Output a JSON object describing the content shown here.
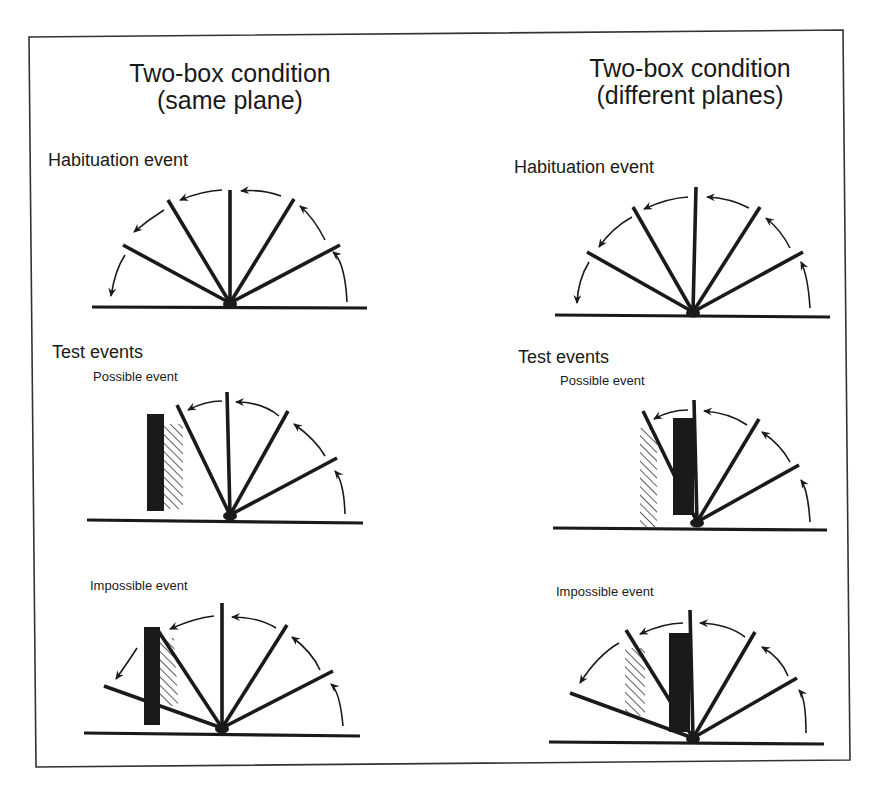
{
  "figure": {
    "frame": {
      "points": "29,37 843,30 850,760 36,767",
      "stroke": "#333333"
    },
    "ink": "#1a1a1a"
  },
  "left_column": {
    "title_line1": "Two-box condition",
    "title_line2": "(same plane)",
    "habituation_label": "Habituation event",
    "test_label": "Test events",
    "possible_label": "Possible event",
    "impossible_label": "Impossible event"
  },
  "right_column": {
    "title_line1": "Two-box condition",
    "title_line2": "(different planes)",
    "habituation_label": "Habituation event",
    "test_label": "Test events",
    "possible_label": "Possible event",
    "impossible_label": "Impossible event"
  },
  "panels": [
    {
      "id": "left-habituation",
      "ground": [
        92,
        307,
        367,
        308
      ],
      "pivot": [
        230,
        303
      ],
      "screen_positions": [
        [
          123,
          245
        ],
        [
          168,
          200
        ],
        [
          230,
          190
        ],
        [
          294,
          199
        ],
        [
          340,
          245
        ]
      ],
      "arrows": [
        {
          "from": [
            347,
            302
          ],
          "ctrl": [
            345,
            262
          ],
          "to": [
            333,
            252
          ]
        },
        {
          "from": [
            325,
            240
          ],
          "ctrl": [
            314,
            218
          ],
          "to": [
            300,
            206
          ]
        },
        {
          "from": [
            281,
            196
          ],
          "ctrl": [
            262,
            189
          ],
          "to": [
            241,
            191
          ]
        },
        {
          "from": [
            222,
            190
          ],
          "ctrl": [
            202,
            191
          ],
          "to": [
            180,
            200
          ]
        },
        {
          "from": [
            164,
            210
          ],
          "ctrl": [
            148,
            220
          ],
          "to": [
            134,
            232
          ]
        },
        {
          "from": [
            125,
            255
          ],
          "ctrl": [
            115,
            270
          ],
          "to": [
            111,
            296
          ]
        }
      ],
      "box": null,
      "hatch": null
    },
    {
      "id": "right-habituation",
      "ground": [
        555,
        315,
        830,
        317
      ],
      "pivot": [
        693,
        312
      ],
      "screen_positions": [
        [
          587,
          252
        ],
        [
          633,
          207
        ],
        [
          696,
          187
        ],
        [
          760,
          207
        ],
        [
          803,
          252
        ]
      ],
      "arrows": [
        {
          "from": [
            810,
            308
          ],
          "ctrl": [
            808,
            276
          ],
          "to": [
            801,
            262
          ]
        },
        {
          "from": [
            790,
            248
          ],
          "ctrl": [
            781,
            230
          ],
          "to": [
            766,
            218
          ]
        },
        {
          "from": [
            749,
            208
          ],
          "ctrl": [
            730,
            198
          ],
          "to": [
            707,
            197
          ]
        },
        {
          "from": [
            688,
            197
          ],
          "ctrl": [
            668,
            198
          ],
          "to": [
            644,
            209
          ]
        },
        {
          "from": [
            632,
            217
          ],
          "ctrl": [
            612,
            228
          ],
          "to": [
            599,
            247
          ]
        },
        {
          "from": [
            589,
            262
          ],
          "ctrl": [
            578,
            280
          ],
          "to": [
            577,
            303
          ]
        }
      ],
      "box": null,
      "hatch": null
    },
    {
      "id": "left-possible",
      "ground": [
        87,
        520,
        363,
        523
      ],
      "pivot": [
        230,
        515
      ],
      "screen_positions": [
        [
          177,
          405
        ],
        [
          227,
          392
        ],
        [
          288,
          411
        ],
        [
          337,
          458
        ]
      ],
      "arrows": [
        {
          "from": [
            345,
            514
          ],
          "ctrl": [
            344,
            482
          ],
          "to": [
            335,
            471
          ]
        },
        {
          "from": [
            325,
            456
          ],
          "ctrl": [
            316,
            440
          ],
          "to": [
            294,
            424
          ]
        },
        {
          "from": [
            279,
            416
          ],
          "ctrl": [
            262,
            402
          ],
          "to": [
            236,
            402
          ]
        },
        {
          "from": [
            222,
            401
          ],
          "ctrl": [
            205,
            401
          ],
          "to": [
            188,
            410
          ]
        }
      ],
      "box": {
        "x": 147,
        "y": 414,
        "w": 17,
        "h": 97
      },
      "hatch": {
        "points": "164,424 183,424 183,509 164,509"
      }
    },
    {
      "id": "right-possible",
      "ground": [
        553,
        528,
        827,
        530
      ],
      "pivot": [
        697,
        522
      ],
      "screen_positions": [
        [
          643,
          411
        ],
        [
          694,
          400
        ],
        [
          759,
          419
        ],
        [
          799,
          465
        ]
      ],
      "arrows": [
        {
          "from": [
            810,
            522
          ],
          "ctrl": [
            808,
            490
          ],
          "to": [
            801,
            480
          ]
        },
        {
          "from": [
            790,
            462
          ],
          "ctrl": [
            781,
            445
          ],
          "to": [
            762,
            432
          ]
        },
        {
          "from": [
            747,
            425
          ],
          "ctrl": [
            730,
            413
          ],
          "to": [
            704,
            411
          ]
        },
        {
          "from": [
            688,
            410
          ],
          "ctrl": [
            670,
            410
          ],
          "to": [
            654,
            419
          ]
        }
      ],
      "box": {
        "x": 673,
        "y": 418,
        "w": 21,
        "h": 97
      },
      "hatch": {
        "points": "640,428 657,428 657,527 640,527"
      }
    },
    {
      "id": "left-impossible",
      "ground": [
        84,
        733,
        360,
        736
      ],
      "pivot": [
        222,
        728
      ],
      "screen_positions": [
        [
          104,
          686
        ],
        [
          157,
          629
        ],
        [
          222,
          603
        ],
        [
          287,
          625
        ],
        [
          333,
          671
        ]
      ],
      "arrows": [
        {
          "from": [
            343,
            726
          ],
          "ctrl": [
            340,
            692
          ],
          "to": [
            331,
            684
          ]
        },
        {
          "from": [
            320,
            670
          ],
          "ctrl": [
            312,
            652
          ],
          "to": [
            292,
            637
          ]
        },
        {
          "from": [
            276,
            628
          ],
          "ctrl": [
            258,
            617
          ],
          "to": [
            232,
            617
          ]
        },
        {
          "from": [
            214,
            616
          ],
          "ctrl": [
            195,
            618
          ],
          "to": [
            170,
            629
          ]
        },
        {
          "from": [
            137,
            648
          ],
          "ctrl": [
            128,
            662
          ],
          "to": [
            116,
            679
          ]
        }
      ],
      "box": {
        "x": 144,
        "y": 627,
        "w": 16,
        "h": 98
      },
      "hatch": {
        "points": "160,638 174,638 178,700 178,708 160,702"
      }
    },
    {
      "id": "right-impossible",
      "ground": [
        549,
        742,
        824,
        744
      ],
      "pivot": [
        693,
        738
      ],
      "screen_positions": [
        [
          570,
          693
        ],
        [
          626,
          630
        ],
        [
          690,
          610
        ],
        [
          755,
          632
        ],
        [
          797,
          678
        ]
      ],
      "arrows": [
        {
          "from": [
            806,
            733
          ],
          "ctrl": [
            806,
            698
          ],
          "to": [
            799,
            690
          ]
        },
        {
          "from": [
            788,
            676
          ],
          "ctrl": [
            781,
            658
          ],
          "to": [
            762,
            647
          ]
        },
        {
          "from": [
            745,
            637
          ],
          "ctrl": [
            728,
            624
          ],
          "to": [
            700,
            623
          ]
        },
        {
          "from": [
            683,
            623
          ],
          "ctrl": [
            664,
            623
          ],
          "to": [
            640,
            634
          ]
        },
        {
          "from": [
            619,
            643
          ],
          "ctrl": [
            598,
            655
          ],
          "to": [
            580,
            683
          ]
        }
      ],
      "box": {
        "x": 669,
        "y": 633,
        "w": 21,
        "h": 99
      },
      "hatch": {
        "points": "625,648 645,648 645,716 625,716"
      }
    }
  ]
}
